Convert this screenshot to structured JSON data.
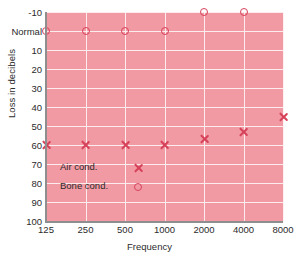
{
  "chart_data": {
    "type": "scatter",
    "title": "",
    "xlabel": "Frequency",
    "ylabel": "Loss in decibels",
    "categories": [
      "125",
      "250",
      "500",
      "1000",
      "2000",
      "4000",
      "8000"
    ],
    "x_tick_labels": [
      "125",
      "250",
      "500",
      "1000",
      "2000",
      "4000",
      "8000"
    ],
    "y_tick_labels": [
      "-10",
      "Normal",
      "10",
      "20",
      "30",
      "40",
      "50",
      "60",
      "70",
      "80",
      "90",
      "100"
    ],
    "y_tick_values": [
      -10,
      0,
      10,
      20,
      30,
      40,
      50,
      60,
      70,
      80,
      90,
      100
    ],
    "ylim": [
      -10,
      100
    ],
    "y_inverted": true,
    "grid": true,
    "legend_position": "inside-lower-left",
    "plot_background": "#f29aa4",
    "grid_color": "#fdf0f1",
    "marker_color": "#d6425a",
    "series": [
      {
        "name": "Air cond.",
        "marker": "x",
        "x": [
          "125",
          "250",
          "500",
          "1000",
          "2000",
          "4000",
          "8000"
        ],
        "values": [
          60,
          60,
          60,
          60,
          57,
          53,
          45
        ]
      },
      {
        "name": "Bone cond.",
        "marker": "o",
        "x": [
          "125",
          "250",
          "500",
          "1000",
          "2000",
          "4000"
        ],
        "values": [
          0,
          0,
          0,
          0,
          -10,
          -10
        ]
      }
    ],
    "legend": [
      {
        "label": "Air cond.",
        "marker": "x"
      },
      {
        "label": "Bone cond.",
        "marker": "o"
      }
    ]
  }
}
